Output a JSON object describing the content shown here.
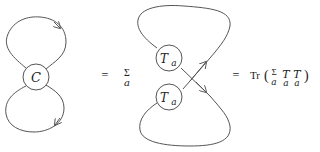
{
  "diagram": {
    "left": {
      "vertex_label": "C"
    },
    "middle": {
      "eq": "=",
      "sum_symbol": "Σ",
      "sum_index": "a",
      "upper_vertex": {
        "base": "T",
        "sub": "a"
      },
      "lower_vertex": {
        "base": "T",
        "sub": "a"
      }
    },
    "right": {
      "eq": "=",
      "trace": "Tr",
      "open_paren": "(",
      "sum_symbol": "Σ",
      "sum_index": "a",
      "t1_base": "T",
      "t1_sub": "a",
      "t2_base": "T",
      "t2_sub": "a",
      "close_paren": ")"
    },
    "stroke_color": "#555555"
  }
}
